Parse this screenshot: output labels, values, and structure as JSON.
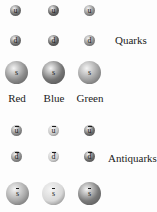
{
  "labels": {
    "quarks": "Quarks",
    "antiquarks": "Antiquarks"
  },
  "color_charges": [
    "Red",
    "Blue",
    "Green"
  ],
  "quarks": {
    "u": [
      {
        "symbol": "u",
        "shade": "#6e6e6e"
      },
      {
        "symbol": "u",
        "shade": "#5e5e5e"
      },
      {
        "symbol": "u",
        "shade": "#8a8a8a"
      }
    ],
    "d": [
      {
        "symbol": "d",
        "shade": "#6e6e6e"
      },
      {
        "symbol": "d",
        "shade": "#5e5e5e"
      },
      {
        "symbol": "d",
        "shade": "#8a8a8a"
      }
    ],
    "s": [
      {
        "symbol": "s",
        "shade": "#8c8c8c"
      },
      {
        "symbol": "s",
        "shade": "#747474"
      },
      {
        "symbol": "s",
        "shade": "#a0a0a0"
      }
    ]
  },
  "antiquarks": {
    "u": [
      {
        "symbol": "u",
        "shade": "#8a8a8a"
      },
      {
        "symbol": "u",
        "shade": "#c8c8c8"
      },
      {
        "symbol": "u",
        "shade": "#6a6a6a"
      }
    ],
    "d": [
      {
        "symbol": "d",
        "shade": "#8a8a8a"
      },
      {
        "symbol": "d",
        "shade": "#d0d0d0"
      },
      {
        "symbol": "d",
        "shade": "#6a6a6a"
      }
    ],
    "s": [
      {
        "symbol": "s",
        "shade": "#a8a8a8"
      },
      {
        "symbol": "s",
        "shade": "#d8d8d8"
      },
      {
        "symbol": "s",
        "shade": "#7a7a7a"
      }
    ]
  }
}
